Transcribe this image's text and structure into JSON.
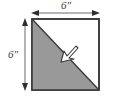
{
  "figure": {
    "background_color": "#ffffff"
  },
  "square": {
    "name": "square",
    "stroke_color": "#3a3a3a",
    "fill_color": "#ffffff",
    "side_label": "6″",
    "x": 32,
    "y": 19,
    "width": 67,
    "height": 71
  },
  "shaded_triangle": {
    "name": "shaded-lower-left-triangle",
    "fill_color": "#999999",
    "vertices": "top-left, bottom-left, bottom-right"
  },
  "diagonal": {
    "name": "diagonal-line",
    "stroke_color": "#3a3a3a",
    "from": "top-left",
    "to": "bottom-right"
  },
  "dimensions": {
    "top": {
      "label": "6″",
      "orientation": "horizontal",
      "arrowheads": "both"
    },
    "left": {
      "label": "6″",
      "orientation": "vertical",
      "arrowheads": "both"
    }
  },
  "pointer": {
    "name": "cursor-arrow-annotation",
    "fill_color": "#ffffff",
    "stroke_color": "#3a3a3a",
    "points_at": "diagonal-line"
  }
}
